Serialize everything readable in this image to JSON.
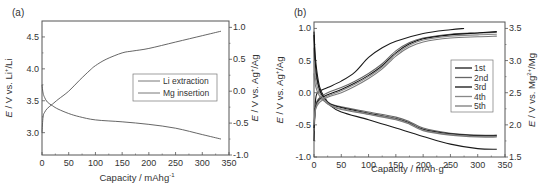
{
  "chart_data": [
    {
      "type": "line",
      "panel_label": "(a)",
      "xlabel": "Capacity / mAhg",
      "xlabel_sup": "-1",
      "ylabel_left": "E / V vs. Li+/Li",
      "ylabel_right": "E / V vs. Ag+/Ag",
      "xlim": [
        0,
        350
      ],
      "ylim_left": [
        2.65,
        4.75
      ],
      "ylim_right": [
        -1.0,
        1.1
      ],
      "x_ticks": [
        0,
        50,
        100,
        150,
        200,
        250,
        300,
        350
      ],
      "y_ticks_left": [
        3.0,
        3.5,
        4.0,
        4.5
      ],
      "y_ticks_left_labels": [
        "3.0",
        "3.5",
        "4.0",
        "4.5"
      ],
      "y_ticks_right": [
        -1.0,
        -0.5,
        0.0,
        0.5,
        1.0
      ],
      "y_ticks_right_labels": [
        "-1.0",
        "-0.5",
        "0.0",
        "0.5",
        "1.0"
      ],
      "grid": false,
      "legend_position": "center-right",
      "series": [
        {
          "name": "Li extraction",
          "axis": "left",
          "color": "#555555",
          "x": [
            0,
            2,
            5,
            10,
            20,
            30,
            50,
            70,
            90,
            100,
            120,
            150,
            170,
            200,
            250,
            300,
            335
          ],
          "y": [
            3.0,
            3.25,
            3.32,
            3.38,
            3.45,
            3.52,
            3.65,
            3.82,
            3.98,
            4.05,
            4.15,
            4.25,
            4.28,
            4.32,
            4.42,
            4.52,
            4.59
          ]
        },
        {
          "name": "Mg insertion",
          "axis": "left",
          "color": "#555555",
          "x": [
            0,
            2,
            5,
            10,
            20,
            30,
            50,
            70,
            100,
            150,
            200,
            250,
            300,
            335
          ],
          "y": [
            3.75,
            3.62,
            3.55,
            3.48,
            3.42,
            3.37,
            3.3,
            3.25,
            3.2,
            3.17,
            3.13,
            3.07,
            2.97,
            2.9
          ]
        }
      ]
    },
    {
      "type": "line",
      "panel_label": "(b)",
      "xlabel": "Capacity / mAh·g",
      "xlabel_sup": "-1",
      "ylabel_left": "E / V vs. Ag+/Ag",
      "ylabel_right": "E / V vs. Mg2+/Mg",
      "xlim": [
        0,
        350
      ],
      "ylim_left": [
        -1.0,
        1.1
      ],
      "ylim_right": [
        1.5,
        3.6
      ],
      "x_ticks": [
        0,
        50,
        100,
        150,
        200,
        250,
        300,
        350
      ],
      "y_ticks_left": [
        -1.0,
        -0.5,
        0.0,
        0.5,
        1.0
      ],
      "y_ticks_left_labels": [
        "-1.0",
        "-0.5",
        "0.0",
        "0.5",
        "1.0"
      ],
      "y_ticks_right": [
        1.5,
        2.0,
        2.5,
        3.0,
        3.5
      ],
      "y_ticks_right_labels": [
        "1.5",
        "2.0",
        "2.5",
        "3.0",
        "3.5"
      ],
      "grid": false,
      "legend_position": "center-right",
      "series": [
        {
          "name": "1st",
          "color": "#1a1a1a",
          "charge": {
            "x": [
              0,
              3,
              10,
              25,
              50,
              75,
              100,
              125,
              150,
              200,
              250,
              275
            ],
            "y": [
              -0.75,
              -0.1,
              0.02,
              0.08,
              0.18,
              0.32,
              0.55,
              0.7,
              0.8,
              0.92,
              0.98,
              1.0
            ]
          },
          "discharge": {
            "x": [
              0,
              3,
              10,
              20,
              30,
              50,
              100,
              150,
              200,
              250,
              300,
              335
            ],
            "y": [
              0.95,
              0.5,
              0.1,
              -0.08,
              -0.2,
              -0.3,
              -0.42,
              -0.55,
              -0.68,
              -0.8,
              -0.87,
              -0.88
            ]
          }
        },
        {
          "name": "2nd",
          "color": "#666666",
          "charge": {
            "x": [
              0,
              3,
              10,
              25,
              50,
              75,
              100,
              125,
              150,
              175,
              200,
              250,
              300,
              335
            ],
            "y": [
              -0.6,
              -0.2,
              -0.08,
              0.0,
              0.08,
              0.18,
              0.3,
              0.45,
              0.65,
              0.78,
              0.85,
              0.91,
              0.93,
              0.94
            ]
          },
          "discharge": {
            "x": [
              0,
              3,
              10,
              20,
              30,
              50,
              100,
              150,
              175,
              200,
              250,
              300,
              335
            ],
            "y": [
              0.7,
              0.3,
              0.05,
              -0.1,
              -0.17,
              -0.22,
              -0.3,
              -0.38,
              -0.45,
              -0.55,
              -0.63,
              -0.66,
              -0.66
            ]
          }
        },
        {
          "name": "3rd",
          "color": "#111111",
          "charge": {
            "x": [
              0,
              3,
              10,
              25,
              50,
              75,
              100,
              125,
              150,
              175,
              200,
              250,
              300,
              335
            ],
            "y": [
              -0.55,
              -0.22,
              -0.1,
              -0.03,
              0.05,
              0.15,
              0.27,
              0.42,
              0.62,
              0.76,
              0.84,
              0.9,
              0.93,
              0.95
            ]
          },
          "discharge": {
            "x": [
              0,
              3,
              10,
              20,
              30,
              50,
              100,
              150,
              175,
              200,
              250,
              300,
              335
            ],
            "y": [
              0.9,
              0.4,
              0.05,
              -0.1,
              -0.18,
              -0.23,
              -0.32,
              -0.4,
              -0.47,
              -0.57,
              -0.64,
              -0.67,
              -0.67
            ]
          }
        },
        {
          "name": "4th",
          "color": "#888888",
          "charge": {
            "x": [
              0,
              3,
              10,
              25,
              50,
              75,
              100,
              125,
              150,
              175,
              200,
              250,
              300,
              335
            ],
            "y": [
              -0.5,
              -0.24,
              -0.12,
              -0.05,
              0.03,
              0.13,
              0.25,
              0.4,
              0.6,
              0.74,
              0.82,
              0.88,
              0.9,
              0.91
            ]
          },
          "discharge": {
            "x": [
              0,
              3,
              10,
              20,
              30,
              50,
              100,
              150,
              175,
              200,
              250,
              300,
              335
            ],
            "y": [
              0.5,
              0.2,
              0.0,
              -0.12,
              -0.19,
              -0.25,
              -0.33,
              -0.41,
              -0.48,
              -0.58,
              -0.65,
              -0.68,
              -0.68
            ]
          }
        },
        {
          "name": "5th",
          "color": "#7a7a7a",
          "charge": {
            "x": [
              0,
              3,
              10,
              25,
              50,
              75,
              100,
              125,
              150,
              175,
              200,
              250,
              300,
              335
            ],
            "y": [
              -0.45,
              -0.26,
              -0.15,
              -0.07,
              0.0,
              0.1,
              0.22,
              0.37,
              0.57,
              0.71,
              0.79,
              0.85,
              0.87,
              0.88
            ]
          },
          "discharge": {
            "x": [
              0,
              3,
              10,
              20,
              30,
              50,
              100,
              150,
              175,
              200,
              250,
              300,
              335
            ],
            "y": [
              0.3,
              0.1,
              -0.05,
              -0.14,
              -0.2,
              -0.26,
              -0.34,
              -0.42,
              -0.49,
              -0.59,
              -0.66,
              -0.69,
              -0.69
            ]
          }
        }
      ]
    }
  ]
}
